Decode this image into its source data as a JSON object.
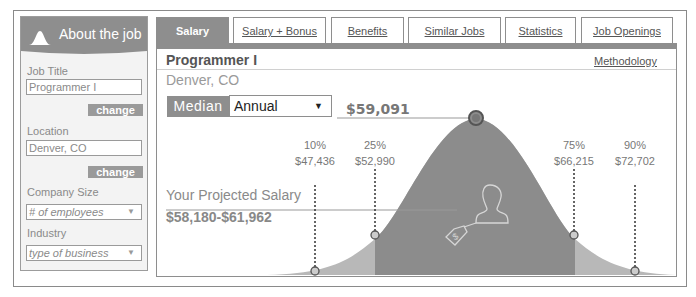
{
  "sidebar": {
    "title": "About the job",
    "job_title_label": "Job Title",
    "job_title_value": "Programmer I",
    "change_label": "change",
    "location_label": "Location",
    "location_value": "Denver, CO",
    "company_size_label": "Company Size",
    "company_size_placeholder": "# of employees",
    "industry_label": "Industry",
    "industry_placeholder": "type of business"
  },
  "tabs": [
    {
      "label": "Salary",
      "active": true
    },
    {
      "label": "Salary + Bonus",
      "active": false
    },
    {
      "label": "Benefits",
      "active": false
    },
    {
      "label": "Similar Jobs",
      "active": false
    },
    {
      "label": "Statistics",
      "active": false
    },
    {
      "label": "Job Openings",
      "active": false
    }
  ],
  "main": {
    "job_title": "Programmer I",
    "location": "Denver, CO",
    "methodology_link": "Methodology",
    "median_label": "Median",
    "period_selected": "Annual",
    "median_value": "$59,091",
    "projected_label": "Your Projected Salary",
    "projected_range": "$58,180-$61,962",
    "percentiles": [
      {
        "pct": "10%",
        "value": "$47,436"
      },
      {
        "pct": "25%",
        "value": "$52,990"
      },
      {
        "pct": "75%",
        "value": "$66,215"
      },
      {
        "pct": "90%",
        "value": "$72,702"
      }
    ]
  },
  "colors": {
    "accent_gray": "#8e8e8e",
    "curve_dark": "#8c8c8c",
    "curve_light": "#b8b8b8"
  }
}
